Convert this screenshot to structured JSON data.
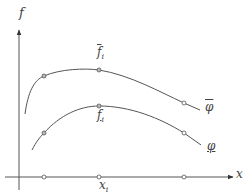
{
  "diagram": {
    "axes": {
      "y_label": "f",
      "x_label": "x"
    },
    "curves": [
      {
        "name": "upper-bound",
        "label": "φ",
        "decoration": "overline",
        "point_label": "f",
        "point_label_sub": "i",
        "point_label_decoration": "overline"
      },
      {
        "name": "lower-bound",
        "label": "φ",
        "decoration": "underline",
        "point_label": "f",
        "point_label_sub": "i",
        "point_label_decoration": "underline"
      }
    ],
    "x_point_label": "x",
    "x_point_label_sub": "i",
    "colors": {
      "line": "#555555",
      "marker": "#666666",
      "text": "#444444"
    }
  }
}
